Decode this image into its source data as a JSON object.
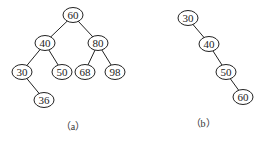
{
  "trees": [
    {
      "caption": "（a）",
      "nodes": [
        {
          "id": "60",
          "label": "60",
          "x": 73,
          "y": 15
        },
        {
          "id": "40",
          "label": "40",
          "x": 45,
          "y": 43
        },
        {
          "id": "80",
          "label": "80",
          "x": 98,
          "y": 43
        },
        {
          "id": "30",
          "label": "30",
          "x": 22,
          "y": 72
        },
        {
          "id": "50",
          "label": "50",
          "x": 62,
          "y": 72
        },
        {
          "id": "68",
          "label": "68",
          "x": 85,
          "y": 72
        },
        {
          "id": "98",
          "label": "98",
          "x": 115,
          "y": 72
        },
        {
          "id": "36",
          "label": "36",
          "x": 44,
          "y": 100
        }
      ],
      "edges": [
        [
          "60",
          "40"
        ],
        [
          "60",
          "80"
        ],
        [
          "40",
          "30"
        ],
        [
          "40",
          "50"
        ],
        [
          "80",
          "68"
        ],
        [
          "80",
          "98"
        ],
        [
          "30",
          "36"
        ]
      ],
      "caption_pos": {
        "x": 73,
        "y": 130
      }
    },
    {
      "caption": "（b）",
      "nodes": [
        {
          "id": "30",
          "label": "30",
          "x": 188,
          "y": 18
        },
        {
          "id": "40",
          "label": "40",
          "x": 209,
          "y": 44
        },
        {
          "id": "50",
          "label": "50",
          "x": 226,
          "y": 72
        },
        {
          "id": "60",
          "label": "60",
          "x": 243,
          "y": 97
        }
      ],
      "edges": [
        [
          "30",
          "40"
        ],
        [
          "40",
          "50"
        ],
        [
          "50",
          "60"
        ]
      ],
      "caption_pos": {
        "x": 203,
        "y": 127
      }
    }
  ]
}
